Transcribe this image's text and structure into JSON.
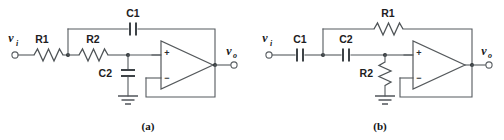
{
  "figure": {
    "background_color": "#ffffff",
    "wire_color": "#555a5e",
    "label_color": "#1d2022"
  },
  "circuits": [
    {
      "id": "a",
      "caption": "(a)",
      "input_port": {
        "symbol": "v",
        "subscript": "i"
      },
      "output_port": {
        "symbol": "v",
        "subscript": "o"
      },
      "components": [
        {
          "name": "R1",
          "label": "R1",
          "type": "resistor",
          "orientation": "horizontal"
        },
        {
          "name": "R2",
          "label": "R2",
          "type": "resistor",
          "orientation": "horizontal"
        },
        {
          "name": "C1",
          "label": "C1",
          "type": "capacitor",
          "orientation": "horizontal"
        },
        {
          "name": "C2",
          "label": "C2",
          "type": "capacitor",
          "orientation": "vertical"
        }
      ],
      "opamp": {
        "plus_label": "+",
        "minus_label": "−"
      },
      "ground": true
    },
    {
      "id": "b",
      "caption": "(b)",
      "input_port": {
        "symbol": "v",
        "subscript": "i"
      },
      "output_port": {
        "symbol": "v",
        "subscript": "o"
      },
      "components": [
        {
          "name": "C1",
          "label": "C1",
          "type": "capacitor",
          "orientation": "horizontal"
        },
        {
          "name": "C2",
          "label": "C2",
          "type": "capacitor",
          "orientation": "horizontal"
        },
        {
          "name": "R1",
          "label": "R1",
          "type": "resistor",
          "orientation": "horizontal"
        },
        {
          "name": "R2",
          "label": "R2",
          "type": "resistor",
          "orientation": "vertical"
        }
      ],
      "opamp": {
        "plus_label": "+",
        "minus_label": "−"
      },
      "ground": true
    }
  ]
}
